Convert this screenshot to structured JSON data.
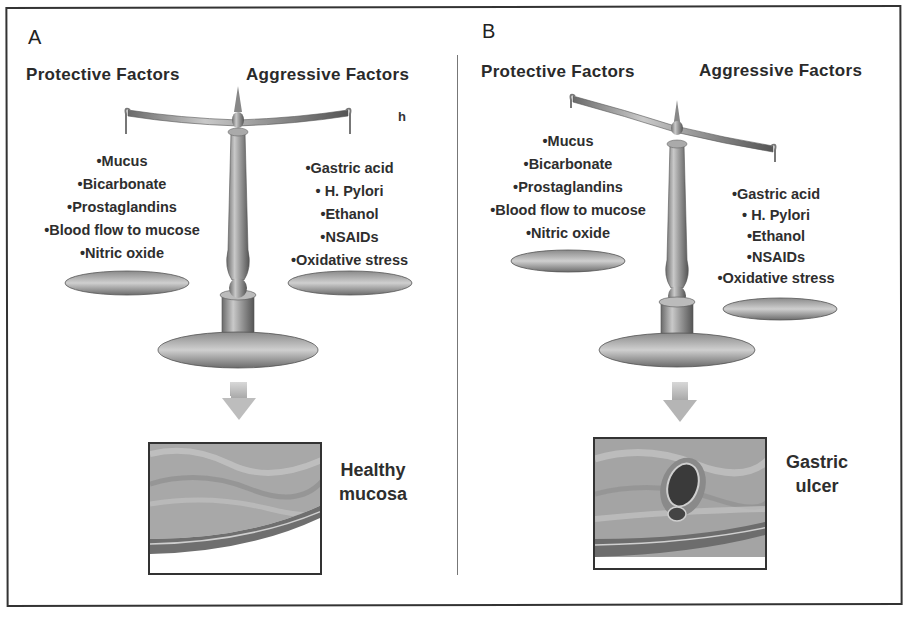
{
  "figure": {
    "panels": [
      {
        "letter": "A",
        "protective_heading": "Protective  Factors",
        "aggressive_heading": "Aggressive  Factors",
        "stray_text": "h",
        "protective_factors": [
          "Mucus",
          "Bicarbonate",
          "Prostaglandins",
          "Blood flow to mucose",
          "Nitric oxide"
        ],
        "aggressive_factors": [
          "Gastric acid",
          " H. Pylori",
          "Ethanol",
          "NSAIDs",
          "Oxidative stress"
        ],
        "balance_state": "balanced",
        "outcome_line1": "Healthy",
        "outcome_line2": "mucosa"
      },
      {
        "letter": "B",
        "protective_heading": "Protective  Factors",
        "aggressive_heading": "Aggressive  Factors",
        "protective_factors": [
          "Mucus",
          "Bicarbonate",
          "Prostaglandins",
          "Blood flow to mucose",
          "Nitric oxide"
        ],
        "aggressive_factors": [
          "Gastric acid",
          " H. Pylori",
          "Ethanol",
          "NSAIDs",
          "Oxidative stress"
        ],
        "balance_state": "tilted-toward-aggressive",
        "outcome_line1": "Gastric",
        "outcome_line2": "ulcer"
      }
    ]
  }
}
